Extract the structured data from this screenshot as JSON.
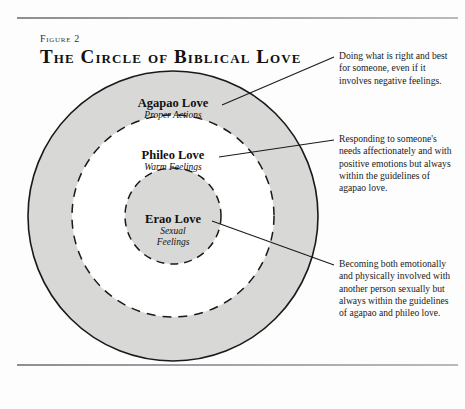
{
  "figure": {
    "label": "Figure 2",
    "title": "The Circle of Biblical Love"
  },
  "rings": {
    "outer": {
      "name": "agapao",
      "title": "Agapao Love",
      "subtitle": "Proper Actions",
      "fill": "#d8d8d6",
      "stroke": "#1a1a1a",
      "style": "solid",
      "radius": 145
    },
    "middle": {
      "name": "phileo",
      "title": "Phileo Love",
      "subtitle": "Warm Feelings",
      "fill": "#ffffff",
      "stroke": "#1a1a1a",
      "style": "dashed",
      "radius": 101
    },
    "inner": {
      "name": "erao",
      "title": "Erao Love",
      "subtitle": "Sexual\nFeelings",
      "subtitle_line1": "Sexual",
      "subtitle_line2": "Feelings",
      "fill": "#d8d8d6",
      "stroke": "#1a1a1a",
      "style": "dashed",
      "radius": 48
    }
  },
  "annotations": {
    "agapao": "Doing what is right and best for someone, even if it involves negative feelings.",
    "phileo": "Responding to someone's needs affectionately and with positive emotions but always within the guidelines of agapao love.",
    "erao": "Becoming both emotionally and physically involved with another person sexually but always within the guidelines of agapao and phileo love."
  },
  "colors": {
    "page_background": "#fdfdfd",
    "ring_gray": "#d8d8d6",
    "ring_white": "#ffffff",
    "ink": "#1a1a1a",
    "rule": "#8d8f92"
  }
}
